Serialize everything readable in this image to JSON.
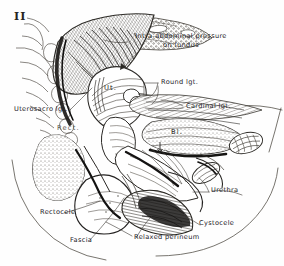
{
  "plate": {
    "figure_number": "II",
    "background_color": "#fefefe",
    "ink_color": "#23211f"
  },
  "labels": {
    "intra_abdominal_line1": "Intra-abdominal  pressure",
    "intra_abdominal_line2": "on  fundus",
    "round_ligament": "Round  lgt.",
    "cardinal_ligament": "Cardinal  lgt.",
    "uterosacral_ligament": "Uterosacro  lgt.",
    "rectocele": "Rectocele",
    "fascia": "Fascia",
    "relaxed_perineum": "Relaxed  perineum",
    "cystocele": "Cystocele",
    "urethra": "Urethra"
  },
  "organ_marks": {
    "uterus": "Ut.",
    "bladder": "Bl.",
    "rectum": "Rect."
  }
}
